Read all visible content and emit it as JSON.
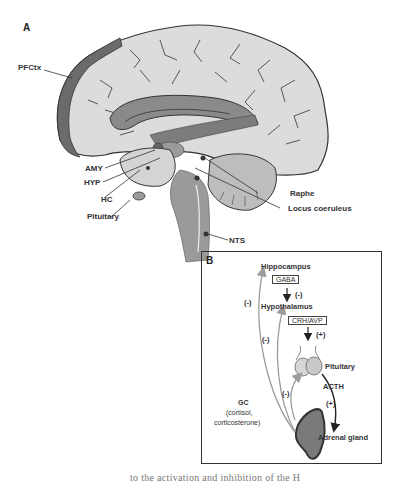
{
  "panelA": {
    "letter": "A",
    "labels": {
      "pfctx": "PFCtx",
      "amy": "AMY",
      "hyp": "HYP",
      "hc": "HC",
      "pituitary": "Pituitary",
      "raphe": "Raphe",
      "locus": "Locus coeruleus",
      "nts": "NTS"
    }
  },
  "panelB": {
    "letter": "B",
    "hippocampus": "Hippocampus",
    "gaba": "GABA",
    "hypothalamus": "Hypothalamus",
    "crh": "CRH/AVP",
    "pituitary": "Pituitary",
    "acth": "ACTH",
    "gc_line1": "GC",
    "gc_line2": "(cortisol,",
    "gc_line3": "corticosterone)",
    "adrenal": "Adrenal gland",
    "signs": {
      "gaba_inhib": "(-)",
      "crh_excite": "(+)",
      "acth_excite": "(+)",
      "fb_hippo": "(-)",
      "fb_hypo": "(-)",
      "fb_pit": "(-)"
    }
  },
  "caption": {
    "fragment": "to the activation and inhibition of the H"
  },
  "colors": {
    "cortex": "#d9d9d9",
    "pfc": "#6b6b6b",
    "corpus": "#8a8a8a",
    "brainstem": "#9a9a9a",
    "adrenal": "#7a7a7a",
    "feedback_arrow": "#9c9c9c"
  }
}
